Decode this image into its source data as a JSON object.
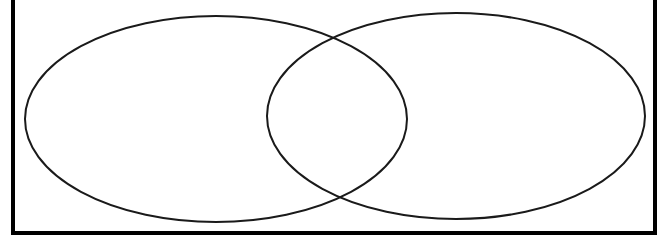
{
  "image": {
    "title": "Two-Set Venn Diagram",
    "width": 666,
    "height": 239,
    "background_color": "#ffffff"
  },
  "frame": {
    "name": "page-border",
    "stroke_color": "#000000",
    "stroke_width": 4,
    "left_x": 13,
    "right_x": 655,
    "bottom_y": 233,
    "top_y": 0,
    "top_edge_visible": false,
    "note": "Rectangular rule border, cropped at top of image"
  },
  "diagram": {
    "type": "venn",
    "set_count": 2,
    "fill": "none",
    "stroke_color": "#1a1a1a",
    "stroke_width": 2,
    "labels_present": false,
    "sets": [
      {
        "name": "left-ellipse",
        "center_x": 216,
        "center_y": 119,
        "radius_x": 191,
        "radius_y": 103,
        "label": "",
        "fill": "none"
      },
      {
        "name": "right-ellipse",
        "center_x": 456,
        "center_y": 116,
        "radius_x": 189,
        "radius_y": 103,
        "label": "",
        "fill": "none"
      }
    ],
    "intersection": {
      "name": "lens-region",
      "label": "",
      "upper_crossing_x": 336,
      "upper_crossing_y": 42,
      "lower_crossing_x": 337,
      "lower_crossing_y": 196,
      "left_extent_x": 268,
      "right_extent_x": 407
    }
  }
}
